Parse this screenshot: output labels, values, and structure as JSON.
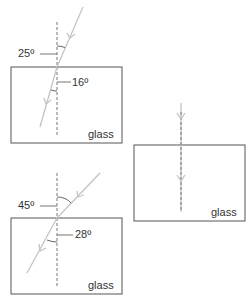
{
  "colors": {
    "box_border": "#555555",
    "normal_line": "#777777",
    "ray": "#c4c4c4",
    "text": "#333333"
  },
  "diagrams": [
    {
      "id": "top-left",
      "material_label": "glass",
      "incidence_angle": "25º",
      "refraction_angle": "16º"
    },
    {
      "id": "bottom-left",
      "material_label": "glass",
      "incidence_angle": "45º",
      "refraction_angle": "28º"
    },
    {
      "id": "right",
      "material_label": "glass",
      "note": "ray along normal, no bending"
    }
  ]
}
